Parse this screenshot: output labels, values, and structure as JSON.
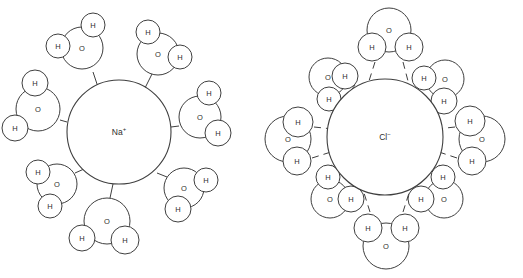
{
  "figure": {
    "background_color": "#ffffff",
    "stroke_color": "#3f3f3f",
    "text_color": "#2e2e2e",
    "width": 523,
    "height": 278
  },
  "panels": [
    {
      "id": "sodium-panel",
      "ion": {
        "symbol": "Na",
        "charge": "+",
        "label": "Na⁺",
        "cx": 119,
        "cy": 132,
        "r": 52
      },
      "bond_style": "solid-stub",
      "bond_count": 8,
      "orientation_note": "oxygen atoms point toward the cation",
      "waters": [
        {
          "name": "water-upper-left",
          "o": {
            "cx": 82,
            "cy": 48,
            "r": 21,
            "label": "O"
          },
          "h": [
            {
              "cx": 58,
              "cy": 46,
              "r": 12,
              "label": "H"
            },
            {
              "cx": 93,
              "cy": 25,
              "r": 12,
              "label": "H"
            }
          ],
          "bond": {
            "x1": 99,
            "y1": 90,
            "x2": 93,
            "y2": 72
          }
        },
        {
          "name": "water-upper-right",
          "o": {
            "cx": 158,
            "cy": 54,
            "r": 21,
            "label": "O"
          },
          "h": [
            {
              "cx": 148,
              "cy": 32,
              "r": 12,
              "label": "H"
            },
            {
              "cx": 180,
              "cy": 57,
              "r": 12,
              "label": "H"
            }
          ],
          "bond": {
            "x1": 145,
            "y1": 88,
            "x2": 152,
            "y2": 74
          }
        },
        {
          "name": "water-left",
          "o": {
            "cx": 38,
            "cy": 109,
            "r": 22,
            "label": "O"
          },
          "h": [
            {
              "cx": 35,
              "cy": 83,
              "r": 13,
              "label": "H"
            },
            {
              "cx": 15,
              "cy": 128,
              "r": 13,
              "label": "H"
            }
          ],
          "bond": {
            "x1": 67,
            "y1": 122,
            "x2": 60,
            "y2": 120
          }
        },
        {
          "name": "water-right",
          "o": {
            "cx": 200,
            "cy": 117,
            "r": 21,
            "label": "O"
          },
          "h": [
            {
              "cx": 209,
              "cy": 93,
              "r": 12,
              "label": "H"
            },
            {
              "cx": 218,
              "cy": 133,
              "r": 13,
              "label": "H"
            }
          ],
          "bond": {
            "x1": 171,
            "y1": 127,
            "x2": 179,
            "y2": 126
          }
        },
        {
          "name": "water-lower-left",
          "o": {
            "cx": 57,
            "cy": 184,
            "r": 20,
            "label": "O"
          },
          "h": [
            {
              "cx": 38,
              "cy": 172,
              "r": 12,
              "label": "H"
            },
            {
              "cx": 50,
              "cy": 206,
              "r": 12,
              "label": "H"
            }
          ],
          "bond": {
            "x1": 84,
            "y1": 169,
            "x2": 75,
            "y2": 173
          }
        },
        {
          "name": "water-lower-right",
          "o": {
            "cx": 184,
            "cy": 188,
            "r": 20,
            "label": "O"
          },
          "h": [
            {
              "cx": 206,
              "cy": 180,
              "r": 12,
              "label": "H"
            },
            {
              "cx": 178,
              "cy": 209,
              "r": 13,
              "label": "H"
            }
          ],
          "bond": {
            "x1": 157,
            "y1": 173,
            "x2": 167,
            "y2": 177
          }
        },
        {
          "name": "water-bottom",
          "o": {
            "cx": 107,
            "cy": 221,
            "r": 23,
            "label": "O"
          },
          "h": [
            {
              "cx": 82,
              "cy": 238,
              "r": 13,
              "label": "H"
            },
            {
              "cx": 125,
              "cy": 240,
              "r": 14,
              "label": "H"
            }
          ],
          "bond": {
            "x1": 113,
            "y1": 184,
            "x2": 110,
            "y2": 198
          }
        }
      ]
    },
    {
      "id": "chloride-panel",
      "ion": {
        "symbol": "Cl",
        "charge": "−",
        "label": "Cl⁻",
        "cx": 385,
        "cy": 137,
        "r": 58
      },
      "bond_style": "dashed-hbond",
      "bond_count": 12,
      "orientation_note": "hydrogen atoms point toward the anion",
      "waters": [
        {
          "name": "water-top",
          "o": {
            "cx": 389,
            "cy": 30,
            "r": 22,
            "label": "O"
          },
          "h": [
            {
              "cx": 372,
              "cy": 47,
              "r": 14,
              "label": "H"
            },
            {
              "cx": 409,
              "cy": 47,
              "r": 14,
              "label": "H"
            }
          ],
          "bonds": [
            {
              "x1": 375,
              "y1": 62,
              "x2": 369,
              "y2": 81
            },
            {
              "x1": 403,
              "y1": 62,
              "x2": 408,
              "y2": 81
            }
          ]
        },
        {
          "name": "water-upper-left",
          "o": {
            "cx": 328,
            "cy": 77,
            "r": 19,
            "label": "O"
          },
          "h": [
            {
              "cx": 345,
              "cy": 76,
              "r": 13,
              "label": "H"
            },
            {
              "cx": 329,
              "cy": 99,
              "r": 12,
              "label": "H"
            }
          ],
          "bonds": [
            {
              "x1": 355,
              "y1": 85,
              "x2": 347,
              "y2": 96
            },
            {
              "x1": 340,
              "y1": 106,
              "x2": 330,
              "y2": 113
            }
          ]
        },
        {
          "name": "water-upper-right",
          "o": {
            "cx": 445,
            "cy": 79,
            "r": 19,
            "label": "O"
          },
          "h": [
            {
              "cx": 424,
              "cy": 78,
              "r": 12,
              "label": "H"
            },
            {
              "cx": 444,
              "cy": 101,
              "r": 13,
              "label": "H"
            }
          ],
          "bonds": [
            {
              "x1": 415,
              "y1": 87,
              "x2": 423,
              "y2": 97
            },
            {
              "x1": 430,
              "y1": 108,
              "x2": 438,
              "y2": 114
            }
          ]
        },
        {
          "name": "water-left",
          "o": {
            "cx": 288,
            "cy": 139,
            "r": 23,
            "label": "O"
          },
          "h": [
            {
              "cx": 298,
              "cy": 122,
              "r": 15,
              "label": "H"
            },
            {
              "cx": 297,
              "cy": 161,
              "r": 14,
              "label": "H"
            }
          ],
          "bonds": [
            {
              "x1": 314,
              "y1": 127,
              "x2": 333,
              "y2": 129
            },
            {
              "x1": 312,
              "y1": 158,
              "x2": 331,
              "y2": 152
            }
          ]
        },
        {
          "name": "water-right",
          "o": {
            "cx": 482,
            "cy": 139,
            "r": 23,
            "label": "O"
          },
          "h": [
            {
              "cx": 470,
              "cy": 121,
              "r": 15,
              "label": "H"
            },
            {
              "cx": 472,
              "cy": 161,
              "r": 14,
              "label": "H"
            }
          ],
          "bonds": [
            {
              "x1": 455,
              "y1": 127,
              "x2": 437,
              "y2": 129
            },
            {
              "x1": 457,
              "y1": 158,
              "x2": 439,
              "y2": 152
            }
          ]
        },
        {
          "name": "water-lower-left",
          "o": {
            "cx": 330,
            "cy": 199,
            "r": 19,
            "label": "O"
          },
          "h": [
            {
              "cx": 328,
              "cy": 177,
              "r": 12,
              "label": "H"
            },
            {
              "cx": 351,
              "cy": 199,
              "r": 13,
              "label": "H"
            }
          ],
          "bonds": [
            {
              "x1": 331,
              "y1": 165,
              "x2": 341,
              "y2": 172
            },
            {
              "x1": 350,
              "y1": 162,
              "x2": 359,
              "y2": 174
            }
          ]
        },
        {
          "name": "water-lower-right",
          "o": {
            "cx": 444,
            "cy": 199,
            "r": 19,
            "label": "O"
          },
          "h": [
            {
              "cx": 443,
              "cy": 177,
              "r": 12,
              "label": "H"
            },
            {
              "cx": 421,
              "cy": 199,
              "r": 13,
              "label": "H"
            }
          ],
          "bonds": [
            {
              "x1": 440,
              "y1": 165,
              "x2": 431,
              "y2": 172
            },
            {
              "x1": 421,
              "y1": 162,
              "x2": 412,
              "y2": 174
            }
          ]
        },
        {
          "name": "water-bottom",
          "o": {
            "cx": 386,
            "cy": 246,
            "r": 23,
            "label": "O"
          },
          "h": [
            {
              "cx": 368,
              "cy": 228,
              "r": 14,
              "label": "H"
            },
            {
              "cx": 405,
              "cy": 228,
              "r": 14,
              "label": "H"
            }
          ],
          "bonds": [
            {
              "x1": 370,
              "y1": 212,
              "x2": 364,
              "y2": 193
            },
            {
              "x1": 403,
              "y1": 212,
              "x2": 409,
              "y2": 193
            }
          ]
        }
      ]
    }
  ]
}
